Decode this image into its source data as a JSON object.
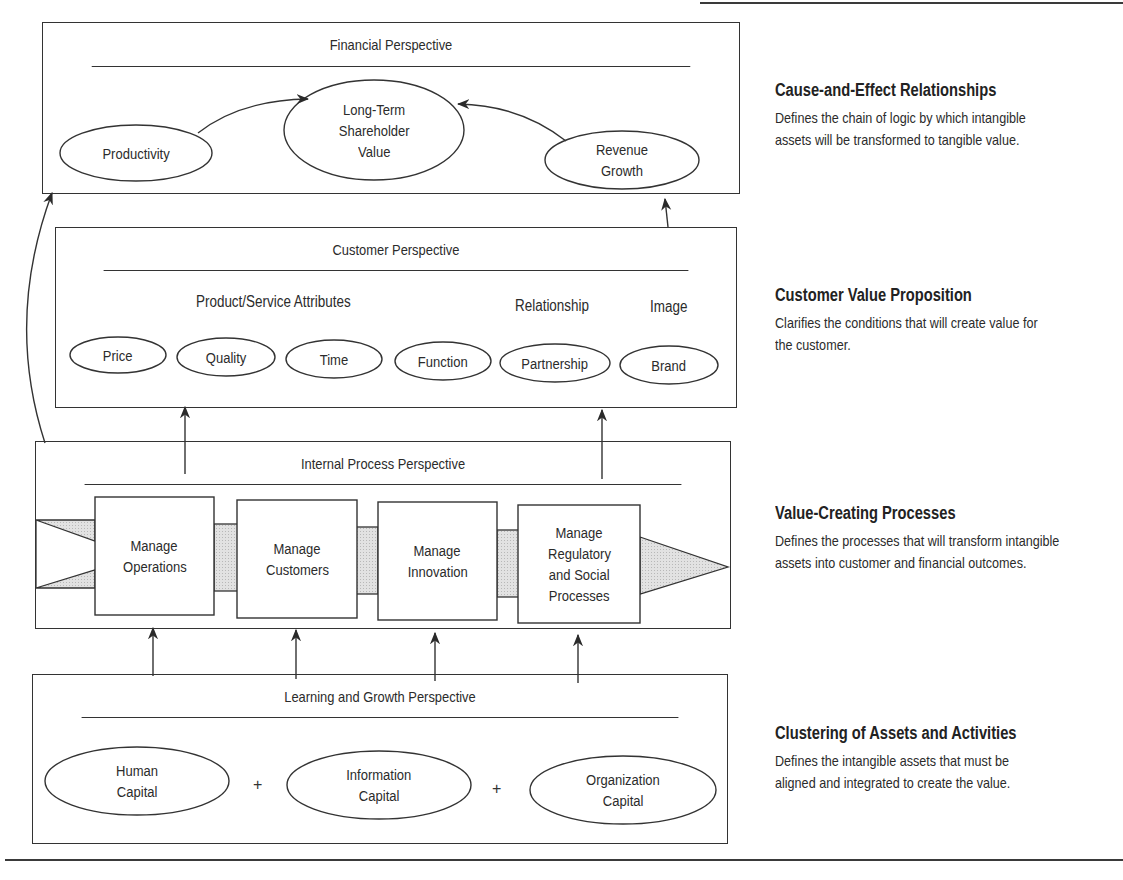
{
  "colors": {
    "stroke": "#333333",
    "text": "#2b2b2b",
    "fill_shaded": "#d6d6d6",
    "background": "#ffffff"
  },
  "perspectives": {
    "financial": {
      "title": "Financial Perspective",
      "nodes": [
        {
          "id": "productivity",
          "label_lines": [
            "Productivity"
          ]
        },
        {
          "id": "long_term_shareholder_value",
          "label_lines": [
            "Long-Term",
            "Shareholder",
            "Value"
          ]
        },
        {
          "id": "revenue_growth",
          "label_lines": [
            "Revenue",
            "Growth"
          ]
        }
      ]
    },
    "customer": {
      "title": "Customer Perspective",
      "group_labels": {
        "attributes": "Product/Service Attributes",
        "relationship": "Relationship",
        "image": "Image"
      },
      "nodes": [
        {
          "id": "price",
          "label": "Price"
        },
        {
          "id": "quality",
          "label": "Quality"
        },
        {
          "id": "time",
          "label": "Time"
        },
        {
          "id": "function",
          "label": "Function"
        },
        {
          "id": "partnership",
          "label": "Partnership"
        },
        {
          "id": "brand",
          "label": "Brand"
        }
      ]
    },
    "internal": {
      "title": "Internal Process Perspective",
      "processes": [
        {
          "id": "operations",
          "label_lines": [
            "Manage",
            "Operations"
          ]
        },
        {
          "id": "customers",
          "label_lines": [
            "Manage",
            "Customers"
          ]
        },
        {
          "id": "innovation",
          "label_lines": [
            "Manage",
            "Innovation"
          ]
        },
        {
          "id": "regulatory",
          "label_lines": [
            "Manage",
            "Regulatory",
            "and Social",
            "Processes"
          ]
        }
      ]
    },
    "learning": {
      "title": "Learning and Growth Perspective",
      "nodes": [
        {
          "id": "human",
          "label_lines": [
            "Human",
            "Capital"
          ]
        },
        {
          "id": "information",
          "label_lines": [
            "Information",
            "Capital"
          ]
        },
        {
          "id": "organization",
          "label_lines": [
            "Organization",
            "Capital"
          ]
        }
      ],
      "operator": "+"
    }
  },
  "descriptions": [
    {
      "title": "Cause-and-Effect Relationships",
      "lines": [
        "Defines the chain of logic by which intangible",
        "assets will be transformed to tangible value."
      ]
    },
    {
      "title": "Customer Value Proposition",
      "lines": [
        "Clarifies the conditions that will create value for",
        "the customer."
      ]
    },
    {
      "title": "Value-Creating Processes",
      "lines": [
        "Defines the processes that will transform intangible",
        "assets into customer and financial outcomes."
      ]
    },
    {
      "title": "Clustering of Assets and Activities",
      "lines": [
        "Defines the intangible assets that must be",
        "aligned and integrated to create the value."
      ]
    }
  ]
}
